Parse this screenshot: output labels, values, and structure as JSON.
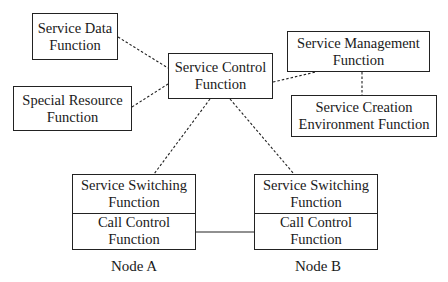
{
  "diagram": {
    "boxes": {
      "service_data": {
        "line1": "Service Data",
        "line2": "Function"
      },
      "special_resource": {
        "line1": "Special Resource",
        "line2": "Function"
      },
      "service_control": {
        "line1": "Service Control",
        "line2": "Function"
      },
      "service_management": {
        "line1": "Service Management",
        "line2": "Function"
      },
      "service_creation": {
        "line1": "Service Creation",
        "line2": "Environment Function"
      }
    },
    "nodes": [
      {
        "label": "Node A",
        "ssf": {
          "line1": "Service Switching",
          "line2": "Function"
        },
        "ccf": {
          "line1": "Call Control",
          "line2": "Function"
        }
      },
      {
        "label": "Node B",
        "ssf": {
          "line1": "Service Switching",
          "line2": "Function"
        },
        "ccf": {
          "line1": "Call Control",
          "line2": "Function"
        }
      }
    ],
    "connections": [
      {
        "from": "Service Data Function",
        "to": "Service Control Function",
        "style": "dashed"
      },
      {
        "from": "Special Resource Function",
        "to": "Service Control Function",
        "style": "dashed"
      },
      {
        "from": "Service Control Function",
        "to": "Service Management Function",
        "style": "dashed"
      },
      {
        "from": "Service Management Function",
        "to": "Service Creation Environment Function",
        "style": "dashed"
      },
      {
        "from": "Service Control Function",
        "to": "Node A Service Switching Function",
        "style": "dashed"
      },
      {
        "from": "Service Control Function",
        "to": "Node B Service Switching Function",
        "style": "dashed"
      },
      {
        "from": "Node A Call Control Function",
        "to": "Node B Call Control Function",
        "style": "solid"
      }
    ]
  }
}
